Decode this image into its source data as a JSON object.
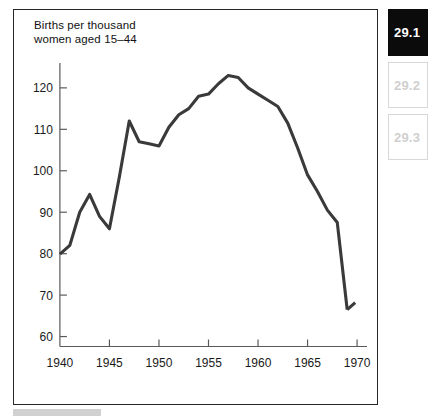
{
  "figure": {
    "title": "Births per thousand\nwomen aged 15–44",
    "border_color": "#262626",
    "line_color": "#3a3a3a"
  },
  "tabs": [
    {
      "label": "29.1",
      "state": "active"
    },
    {
      "label": "29.2",
      "state": "inactive"
    },
    {
      "label": "29.3",
      "state": "inactive"
    }
  ],
  "chart_data": {
    "type": "line",
    "title": "Births per thousand women aged 15–44",
    "xlabel": "",
    "ylabel": "Births per thousand women aged 15–44",
    "xlim": [
      1939,
      1971
    ],
    "ylim": [
      57,
      126
    ],
    "xticks": [
      1940,
      1945,
      1950,
      1955,
      1960,
      1965,
      1970
    ],
    "yticks": [
      60,
      70,
      80,
      90,
      100,
      110,
      120
    ],
    "grid": false,
    "legend": "none",
    "series": [
      {
        "name": "Births per thousand women aged 15-44",
        "x": [
          1940,
          1941,
          1942,
          1943,
          1944,
          1945,
          1946,
          1947,
          1948,
          1949,
          1950,
          1951,
          1952,
          1953,
          1954,
          1955,
          1956,
          1957,
          1958,
          1959,
          1960,
          1961,
          1962,
          1963,
          1964,
          1965,
          1966,
          1967,
          1968,
          1969
        ],
        "values": [
          79.9,
          82.0,
          90.0,
          94.3,
          89.0,
          86.0,
          98.5,
          112.0,
          107.0,
          106.5,
          106.0,
          110.5,
          113.5,
          115.0,
          118.0,
          118.5,
          121.0,
          123.0,
          122.5,
          120.0,
          118.5,
          117.0,
          115.5,
          111.5,
          105.5,
          99.0,
          95.0,
          90.5,
          87.5,
          66.5
        ]
      }
    ],
    "annotations": [
      {
        "text": "final segment ends with slight upturn to about 68"
      }
    ]
  }
}
